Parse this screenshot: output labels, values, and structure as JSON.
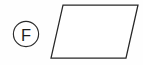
{
  "figure": {
    "background_color": "#fefefe",
    "stroke_color": "#272727",
    "label": {
      "letter": "F",
      "icon_name": "circled-letter-badge",
      "circle": {
        "cx": 26,
        "cy": 34,
        "r": 12.6
      },
      "text_color": "#1c1c1c"
    },
    "shape": {
      "name": "parallelogram",
      "type": "quadrilateral",
      "fill": "none",
      "points_label": "63,5 138,5 126,58 51,58",
      "vertices": [
        {
          "name": "top-left",
          "x": 63,
          "y": 5
        },
        {
          "name": "top-right",
          "x": 138,
          "y": 5
        },
        {
          "name": "bottom-right",
          "x": 126,
          "y": 58
        },
        {
          "name": "bottom-left",
          "x": 51,
          "y": 58
        }
      ],
      "edges": [
        {
          "name": "top-edge",
          "length_px": 75,
          "orientation": "horizontal"
        },
        {
          "name": "right-edge",
          "length_px": 54,
          "orientation": "slanted"
        },
        {
          "name": "bottom-edge",
          "length_px": 75,
          "orientation": "horizontal"
        },
        {
          "name": "left-edge",
          "length_px": 54,
          "orientation": "slanted"
        }
      ]
    }
  }
}
